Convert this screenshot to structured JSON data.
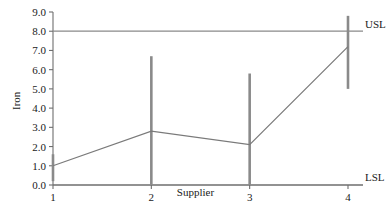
{
  "chart_data": {
    "type": "line",
    "title": "",
    "subtitle": "",
    "xlabel": "Supplier",
    "ylabel": "Iron",
    "categories": [
      "1",
      "2",
      "3",
      "4"
    ],
    "x": [
      1,
      2,
      3,
      4
    ],
    "xlim": [
      0.6,
      4.35
    ],
    "ylim": [
      0.0,
      9.0
    ],
    "grid": false,
    "legend": null,
    "y_ticks": [
      "0.0",
      "1.0",
      "2.0",
      "3.0",
      "4.0",
      "5.0",
      "6.0",
      "7.0",
      "8.0",
      "9.0"
    ],
    "y_tick_values": [
      0.0,
      1.0,
      2.0,
      3.0,
      4.0,
      5.0,
      6.0,
      7.0,
      8.0,
      9.0
    ],
    "x_ticks": [
      "1",
      "2",
      "3",
      "4"
    ],
    "series": [
      {
        "name": "Mean Iron",
        "type": "line",
        "values": [
          1.0,
          2.8,
          2.1,
          7.2
        ]
      },
      {
        "name": "Range",
        "type": "vertical-range-bar",
        "low": [
          0.2,
          0.0,
          0.0,
          5.0
        ],
        "high": [
          1.6,
          6.7,
          5.8,
          8.8
        ]
      }
    ],
    "reference_lines": [
      {
        "name": "USL",
        "label": "USL",
        "value": 8.0
      },
      {
        "name": "LSL",
        "label": "LSL",
        "value": 0.0
      }
    ],
    "colors": {
      "line": "#7a7a7a",
      "range_bar": "#8a8a8a",
      "axis": "#6e6e6e",
      "reference_line": "#8a8a8a",
      "text": "#1a1a1a",
      "background": "#ffffff"
    }
  }
}
